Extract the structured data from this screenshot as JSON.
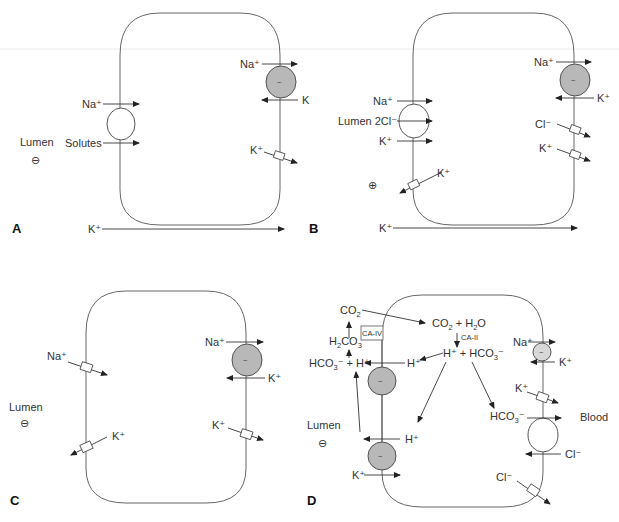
{
  "figure": {
    "background": "#ffffff",
    "line_color": "#333333",
    "pump_fill": "#b8b8b8"
  },
  "panels": {
    "A": {
      "letter": "A",
      "lumen_label": "Lumen",
      "lumen_charge": "⊖",
      "apical": {
        "carrier_top_ion": "Na⁺",
        "carrier_bottom_ion": "Solutes"
      },
      "basolateral": {
        "pump_out_ion": "Na⁺",
        "pump_in_ion": "K",
        "channel_ion": "K⁺"
      },
      "paracellular_ion": "K⁺"
    },
    "B": {
      "letter": "B",
      "lumen_charge": "⊕",
      "apical": {
        "carrier_ion_1": "Na⁺",
        "carrier_ion_2": "Lumen 2Cl⁻",
        "carrier_ion_3": "K⁺",
        "channel_ion": "K⁺"
      },
      "basolateral": {
        "pump_out_ion": "Na⁺",
        "pump_in_ion": "K⁺",
        "channel_ion_1": "Cl⁻",
        "channel_ion_2": "K⁺"
      },
      "paracellular_ion": "K⁺"
    },
    "C": {
      "letter": "C",
      "lumen_label": "Lumen",
      "lumen_charge": "⊖",
      "apical": {
        "channel_ion_1": "Na⁺",
        "channel_ion_2": "K⁺"
      },
      "basolateral": {
        "pump_out_ion": "Na⁺",
        "pump_in_ion": "K⁺",
        "channel_ion": "K⁺"
      }
    },
    "D": {
      "letter": "D",
      "lumen_label": "Lumen",
      "lumen_charge": "⊖",
      "blood_label": "Blood",
      "luminal": {
        "co2": "CO",
        "co2_sub": "2",
        "h2co3_a": "H",
        "h2co3_sub1": "2",
        "h2co3_b": "CO",
        "h2co3_sub2": "3",
        "enzyme_luminal": "CA-IV",
        "hco3_plus_h_a": "HCO",
        "hco3_plus_h_sub": "3",
        "hco3_plus_h_b": "⁻ + H⁺"
      },
      "intracellular": {
        "co2_h2o_a": "CO",
        "co2_h2o_sub1": "2",
        "co2_h2o_b": " + H",
        "co2_h2o_sub2": "2",
        "co2_h2o_c": "O",
        "enzyme_cytosolic": "CA-II",
        "h_hco3_a": "H⁺ + HCO",
        "h_hco3_sub": "3",
        "h_hco3_b": "⁻",
        "apical_h_1": "H⁺",
        "apical_h_2": "H⁺",
        "apical_k": "K⁺"
      },
      "basolateral": {
        "pump_out_ion": "Na⁺",
        "pump_in_ion": "K⁺",
        "channel_ion": "K⁺",
        "exchanger_out_a": "HCO",
        "exchanger_out_sub": "3",
        "exchanger_out_b": "⁻",
        "exchanger_in_ion": "Cl⁻",
        "cl_channel_ion": "Cl⁻"
      }
    }
  }
}
